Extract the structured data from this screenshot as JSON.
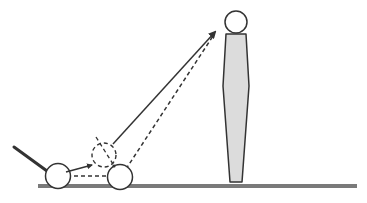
{
  "diagram": {
    "colors": {
      "stroke": "#333333",
      "ground": "#7a7a7a",
      "pin_fill": "#dcdcdc",
      "background": "#ffffff"
    },
    "elements": {
      "cue_stick": "stick",
      "cue_ball": "solid ball",
      "object_ball": "solid ball",
      "ghost_ball": "dashed ball",
      "pin": "pin",
      "trajectory_solid": "solid arrow",
      "trajectory_dashed": "dashed line"
    }
  }
}
